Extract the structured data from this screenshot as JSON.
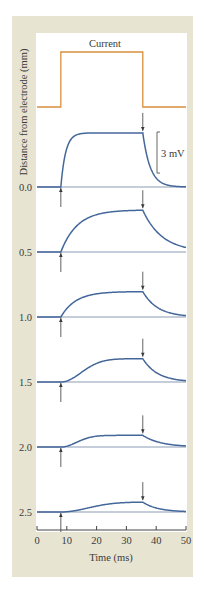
{
  "chart_data": {
    "type": "line",
    "title": "",
    "xlabel": "Time (ms)",
    "ylabel": "Distance from electrode (mm)",
    "xlim": [
      0,
      50
    ],
    "xticks": [
      0,
      10,
      20,
      30,
      40,
      50
    ],
    "xtick_labels": [
      "0",
      "10",
      "20",
      "30",
      "40",
      "50"
    ],
    "grid": false,
    "current": {
      "label": "Current",
      "on_ms": 8,
      "off_ms": 35.5,
      "color": "#d98f3e"
    },
    "scale_bar": {
      "label": "3 mV",
      "value_mV": 3
    },
    "trace_color": "#44679a",
    "baseline_color": "#8a9bb3",
    "arrow_color": "#3a3a3a",
    "series": [
      {
        "name": "0.0",
        "distance_mm": 0.0,
        "peak_mV": 3.95,
        "tau_rise_ms": 1.6,
        "tau_decay_ms": 2.5,
        "shape": "exp"
      },
      {
        "name": "0.5",
        "distance_mm": 0.5,
        "peak_mV": 3.05,
        "tau_rise_ms": 5.5,
        "tau_decay_ms": 6.5,
        "shape": "exp"
      },
      {
        "name": "1.0",
        "distance_mm": 1.0,
        "peak_mV": 1.85,
        "tau_rise_ms": 5.0,
        "tau_decay_ms": 5.0,
        "shape": "exp"
      },
      {
        "name": "1.5",
        "distance_mm": 1.5,
        "peak_mV": 1.7,
        "tau_rise_ms": 9.0,
        "tau_decay_ms": 5.0,
        "shape": "sigmoid"
      },
      {
        "name": "2.0",
        "distance_mm": 2.0,
        "peak_mV": 0.85,
        "tau_rise_ms": 7.0,
        "tau_decay_ms": 6.0,
        "shape": "sigmoid"
      },
      {
        "name": "2.5",
        "distance_mm": 2.5,
        "peak_mV": 0.72,
        "tau_rise_ms": 12.0,
        "tau_decay_ms": 5.0,
        "shape": "sigmoid"
      }
    ]
  }
}
